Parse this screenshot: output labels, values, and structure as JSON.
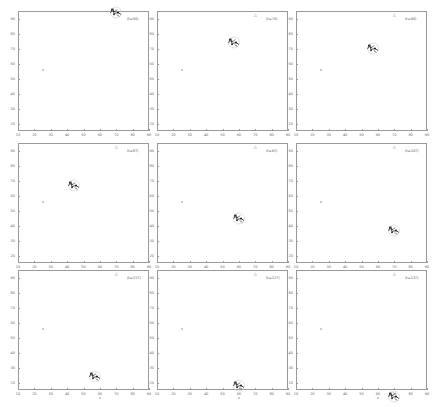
{
  "chart_data": [
    {
      "type": "scatter",
      "label": "(t=50)",
      "start": [
        25,
        56
      ],
      "target": [
        70,
        93
      ],
      "goal": null,
      "swarm": [
        70,
        93
      ]
    },
    {
      "type": "scatter",
      "label": "(t=70)",
      "start": [
        25,
        56
      ],
      "target": [
        70,
        93
      ],
      "goal": null,
      "swarm": [
        57,
        73
      ]
    },
    {
      "type": "scatter",
      "label": "(t=90)",
      "start": [
        25,
        56
      ],
      "target": [
        70,
        93
      ],
      "goal": null,
      "swarm": [
        57,
        69
      ]
    },
    {
      "type": "scatter",
      "label": "(t=87)",
      "start": [
        25,
        56
      ],
      "target": [
        70,
        93
      ],
      "goal": [
        60,
        10
      ],
      "swarm": [
        44,
        66
      ]
    },
    {
      "type": "scatter",
      "label": "(t=97)",
      "start": [
        25,
        56
      ],
      "target": [
        70,
        93
      ],
      "goal": [
        60,
        10
      ],
      "swarm": [
        60,
        44
      ]
    },
    {
      "type": "scatter",
      "label": "(t=107)",
      "start": [
        25,
        56
      ],
      "target": [
        70,
        93
      ],
      "goal": [
        60,
        10
      ],
      "swarm": [
        70,
        36
      ]
    },
    {
      "type": "scatter",
      "label": "(t=117)",
      "start": [
        25,
        56
      ],
      "target": [
        70,
        93
      ],
      "goal": [
        60,
        10
      ],
      "swarm": [
        57,
        23
      ]
    },
    {
      "type": "scatter",
      "label": "(t=127)",
      "start": [
        25,
        56
      ],
      "target": [
        70,
        93
      ],
      "goal": [
        60,
        10
      ],
      "swarm": [
        60,
        17
      ]
    },
    {
      "type": "scatter",
      "label": "(t=137)",
      "start": [
        25,
        56
      ],
      "target": [
        70,
        93
      ],
      "goal": [
        60,
        10
      ],
      "swarm": [
        70,
        10
      ]
    }
  ],
  "axes": {
    "xlim": [
      10,
      90
    ],
    "ylim": [
      15,
      95
    ],
    "xticks": [
      10,
      20,
      30,
      40,
      50,
      60,
      70,
      80,
      90
    ],
    "yticks": [
      20,
      30,
      40,
      50,
      60,
      70,
      80,
      90
    ],
    "grid": false
  }
}
